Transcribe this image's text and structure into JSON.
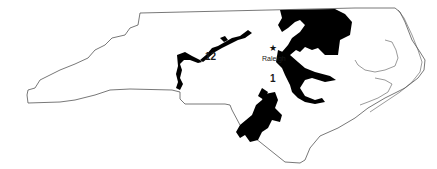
{
  "map": {
    "region": "North Carolina",
    "colors": {
      "background": "#ffffff",
      "outline": "#555555",
      "district_fill": "#000000"
    },
    "districts": [
      {
        "id": "district-1",
        "label": "1"
      },
      {
        "id": "district-12",
        "label": "12"
      }
    ],
    "cities": [
      {
        "name": "Raleigh",
        "marker": "star-icon"
      }
    ]
  }
}
